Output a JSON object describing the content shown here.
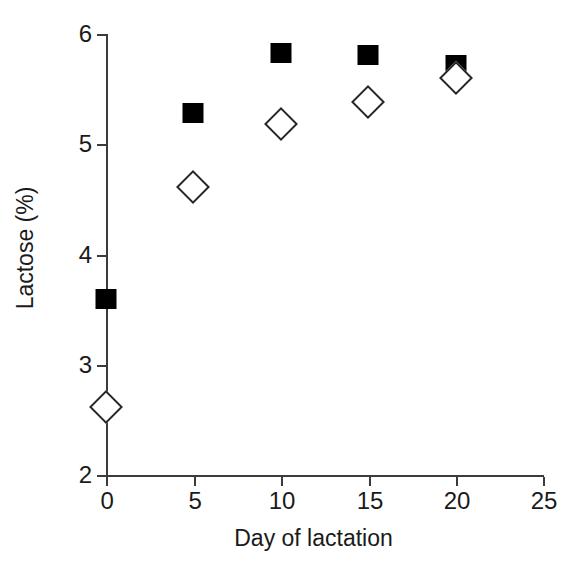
{
  "chart_data": {
    "type": "scatter",
    "title": "",
    "xlabel": "Day of lactation",
    "ylabel": "Lactose (%)",
    "xlim": [
      0,
      25
    ],
    "ylim": [
      2,
      6
    ],
    "xticks": [
      "0",
      "5",
      "10",
      "15",
      "20",
      "25"
    ],
    "yticks": [
      "6",
      "5",
      "4",
      "3",
      "2"
    ],
    "grid": false,
    "legend": "none",
    "x": [
      0,
      5,
      10,
      15,
      20
    ],
    "series": [
      {
        "name": "filled-square-series",
        "marker": "filled-square",
        "color": "#000000",
        "values": [
          3.6,
          5.28,
          5.83,
          5.81,
          5.72
        ]
      },
      {
        "name": "open-diamond-series",
        "marker": "open-diamond",
        "color": "#ffffff",
        "edge_color": "#262626",
        "values": [
          2.62,
          4.61,
          5.18,
          5.38,
          5.6
        ]
      }
    ]
  },
  "axes": {
    "y_title": "Lactose (%)",
    "x_title": "Day of lactation",
    "y_tick_labels": [
      "6",
      "5",
      "4",
      "3",
      "2"
    ],
    "x_tick_labels": [
      "0",
      "5",
      "10",
      "15",
      "20",
      "25"
    ]
  }
}
